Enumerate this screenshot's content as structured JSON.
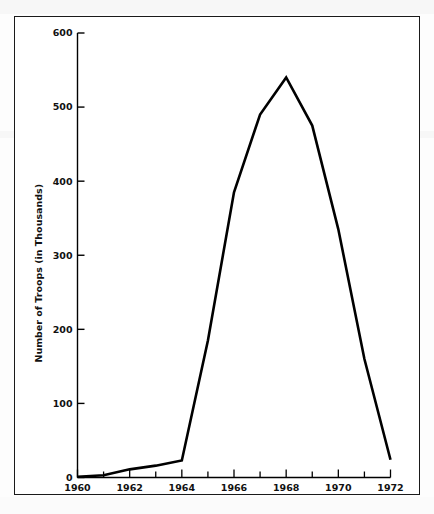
{
  "figure": {
    "frame_border_color": "#1a1a1a",
    "background_color": "#ffffff",
    "line_color": "#000000"
  },
  "chart_data": {
    "type": "line",
    "title": "",
    "xlabel": "",
    "ylabel": "Number of Troops (in Thousands)",
    "x": [
      1960,
      1961,
      1962,
      1963,
      1964,
      1965,
      1966,
      1967,
      1968,
      1969,
      1970,
      1971,
      1972
    ],
    "values": [
      1,
      3,
      11,
      16,
      23,
      185,
      385,
      490,
      540,
      475,
      335,
      160,
      24
    ],
    "series": [
      {
        "name": "U.S. Troops in Vietnam",
        "values": [
          1,
          3,
          11,
          16,
          23,
          185,
          385,
          490,
          540,
          475,
          335,
          160,
          24
        ]
      }
    ],
    "xlim": [
      1960,
      1972
    ],
    "ylim": [
      0,
      600
    ],
    "y_ticks": [
      0,
      100,
      200,
      300,
      400,
      500,
      600
    ],
    "y_tick_labels": [
      "0",
      "100",
      "200",
      "300",
      "400",
      "500",
      "600"
    ],
    "x_ticks": [
      1960,
      1961,
      1962,
      1963,
      1964,
      1965,
      1966,
      1967,
      1968,
      1969,
      1970,
      1971,
      1972
    ],
    "x_tick_labels": [
      "1960",
      "",
      "1962",
      "",
      "1964",
      "",
      "1966",
      "",
      "1968",
      "",
      "1970",
      "",
      "1972"
    ],
    "x_major_labels": [
      "1960",
      "1962",
      "1964",
      "1966",
      "1968",
      "1970",
      "1972"
    ],
    "grid": false,
    "legend": null,
    "legend_position": "none",
    "annotations": []
  }
}
